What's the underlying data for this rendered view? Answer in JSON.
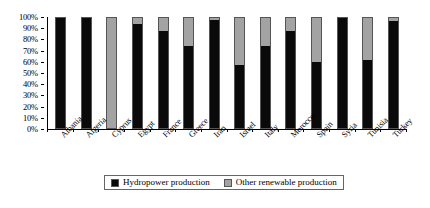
{
  "chart_data": {
    "type": "bar",
    "stacked": true,
    "stacked_percent": true,
    "title": "",
    "xlabel": "",
    "ylabel": "",
    "ylim": [
      0,
      100
    ],
    "ytick_labels": [
      "0%",
      "10%",
      "20%",
      "30%",
      "40%",
      "50%",
      "60%",
      "70%",
      "80%",
      "90%",
      "100%"
    ],
    "ytick_values": [
      0,
      10,
      20,
      30,
      40,
      50,
      60,
      70,
      80,
      90,
      100
    ],
    "grid": false,
    "legend_position": "bottom",
    "categories": [
      "Albania",
      "Algeria",
      "Cyprus",
      "Egypt",
      "France",
      "Greece",
      "Iran",
      "Israel",
      "Italy",
      "Morocco",
      "Spain",
      "Syria",
      "Tunisia",
      "Turkey"
    ],
    "series": [
      {
        "name": "Hydropower production",
        "color": "#0a0a0a",
        "values": [
          100,
          100,
          0,
          95,
          88,
          75,
          98,
          57,
          75,
          88,
          60,
          100,
          62,
          97
        ]
      },
      {
        "name": "Other renewable production",
        "color": "#a3a3a3",
        "values": [
          0,
          0,
          100,
          5,
          12,
          25,
          2,
          43,
          25,
          12,
          40,
          0,
          38,
          3
        ]
      }
    ]
  },
  "legend": {
    "entries": [
      {
        "label": "Hydropower production",
        "swatch": "hydro"
      },
      {
        "label": "Other renewable production",
        "swatch": "other"
      }
    ]
  }
}
